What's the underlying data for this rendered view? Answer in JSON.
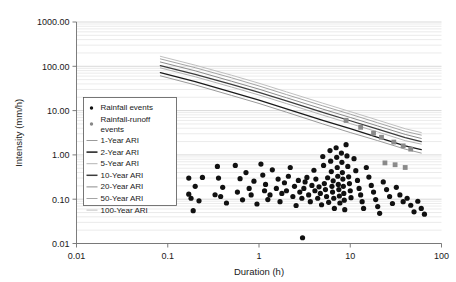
{
  "chart_data": {
    "type": "scatter",
    "title": "",
    "xlabel": "Duration (h)",
    "ylabel": "Intensity (mm/h)",
    "xscale": "log",
    "yscale": "log",
    "xlim": [
      0.01,
      100
    ],
    "ylim": [
      0.01,
      1000
    ],
    "xticks": [
      "0.01",
      "0.1",
      "1",
      "10",
      "100"
    ],
    "xtick_values": [
      0.01,
      0.1,
      1,
      10,
      100
    ],
    "yticks": [
      "0.01",
      "0.10",
      "1.00",
      "10.00",
      "100.00",
      "1000.00"
    ],
    "ytick_values": [
      0.01,
      0.1,
      1,
      10,
      100,
      1000
    ],
    "grid": "minor-horizontal",
    "legend_position": "upper-left-inside",
    "legend_entries": [
      {
        "label": "Rainfall events",
        "marker": "dot",
        "color": "#111111"
      },
      {
        "label": "Rainfall-runoff events",
        "marker": "dot",
        "color": "#888888"
      },
      {
        "label": "1-Year ARI",
        "marker": "line",
        "color": "#9a9a9a"
      },
      {
        "label": "2-Year ARI",
        "marker": "line",
        "color": "#1a1a1a"
      },
      {
        "label": "5-Year ARI",
        "marker": "line",
        "color": "#b4b4b4"
      },
      {
        "label": "10-Year ARI",
        "marker": "line",
        "color": "#3c3c3c"
      },
      {
        "label": "20-Year ARI",
        "marker": "line",
        "color": "#8c8c8c"
      },
      {
        "label": "50-Year ARI",
        "marker": "line",
        "color": "#a5a5a5"
      },
      {
        "label": "100-Year ARI",
        "marker": "line",
        "color": "#c0c0c0"
      }
    ],
    "series": [
      {
        "name": "1-Year ARI",
        "type": "line",
        "color": "#9a9a9a",
        "width": 1.0,
        "points": [
          [
            0.083,
            61
          ],
          [
            0.2,
            38
          ],
          [
            0.5,
            22
          ],
          [
            1,
            14.5
          ],
          [
            2,
            9.2
          ],
          [
            5,
            5.0
          ],
          [
            10,
            3.2
          ],
          [
            20,
            2.1
          ],
          [
            40,
            1.35
          ],
          [
            60,
            1.1
          ]
        ]
      },
      {
        "name": "2-Year ARI",
        "type": "line",
        "color": "#1a1a1a",
        "width": 1.3,
        "points": [
          [
            0.083,
            72
          ],
          [
            0.2,
            45
          ],
          [
            0.5,
            26
          ],
          [
            1,
            17.2
          ],
          [
            2,
            11.0
          ],
          [
            5,
            6.0
          ],
          [
            10,
            3.9
          ],
          [
            20,
            2.5
          ],
          [
            40,
            1.6
          ],
          [
            60,
            1.32
          ]
        ]
      },
      {
        "name": "5-Year ARI",
        "type": "line",
        "color": "#b4b4b4",
        "width": 1.0,
        "points": [
          [
            0.083,
            92
          ],
          [
            0.2,
            58
          ],
          [
            0.5,
            34
          ],
          [
            1,
            22.5
          ],
          [
            2,
            14.4
          ],
          [
            5,
            7.9
          ],
          [
            10,
            5.1
          ],
          [
            20,
            3.3
          ],
          [
            40,
            2.1
          ],
          [
            60,
            1.75
          ]
        ]
      },
      {
        "name": "10-Year ARI",
        "type": "line",
        "color": "#3c3c3c",
        "width": 1.3,
        "points": [
          [
            0.083,
            104
          ],
          [
            0.2,
            66
          ],
          [
            0.5,
            39
          ],
          [
            1,
            25.8
          ],
          [
            2,
            16.5
          ],
          [
            5,
            9.1
          ],
          [
            10,
            5.9
          ],
          [
            20,
            3.8
          ],
          [
            40,
            2.45
          ],
          [
            60,
            2.0
          ]
        ]
      },
      {
        "name": "20-Year ARI",
        "type": "line",
        "color": "#8c8c8c",
        "width": 1.0,
        "points": [
          [
            0.083,
            125
          ],
          [
            0.2,
            79
          ],
          [
            0.5,
            46
          ],
          [
            1,
            30.5
          ],
          [
            2,
            19.5
          ],
          [
            5,
            10.8
          ],
          [
            10,
            7.0
          ],
          [
            20,
            4.5
          ],
          [
            40,
            2.9
          ],
          [
            60,
            2.35
          ]
        ]
      },
      {
        "name": "50-Year ARI",
        "type": "line",
        "color": "#a5a5a5",
        "width": 1.0,
        "points": [
          [
            0.083,
            147
          ],
          [
            0.2,
            93
          ],
          [
            0.5,
            55
          ],
          [
            1,
            36.0
          ],
          [
            2,
            23.0
          ],
          [
            5,
            12.8
          ],
          [
            10,
            8.3
          ],
          [
            20,
            5.3
          ],
          [
            40,
            3.4
          ],
          [
            60,
            2.8
          ]
        ]
      },
      {
        "name": "100-Year ARI",
        "type": "line",
        "color": "#c0c0c0",
        "width": 1.0,
        "points": [
          [
            0.083,
            168
          ],
          [
            0.2,
            106
          ],
          [
            0.5,
            63
          ],
          [
            1,
            41.5
          ],
          [
            2,
            26.5
          ],
          [
            5,
            14.7
          ],
          [
            10,
            9.5
          ],
          [
            20,
            6.1
          ],
          [
            40,
            3.9
          ],
          [
            60,
            3.2
          ]
        ]
      },
      {
        "name": "Rainfall events",
        "type": "scatter",
        "color": "#111111",
        "marker_size": 2.6,
        "points": [
          [
            0.17,
            0.13
          ],
          [
            0.17,
            0.3
          ],
          [
            0.18,
            0.105
          ],
          [
            0.19,
            0.055
          ],
          [
            0.2,
            0.195
          ],
          [
            0.22,
            0.092
          ],
          [
            0.24,
            0.31
          ],
          [
            0.33,
            0.126
          ],
          [
            0.35,
            0.55
          ],
          [
            0.36,
            0.3
          ],
          [
            0.38,
            0.115
          ],
          [
            0.4,
            0.185
          ],
          [
            0.44,
            0.082
          ],
          [
            0.55,
            0.58
          ],
          [
            0.58,
            0.145
          ],
          [
            0.62,
            0.29
          ],
          [
            0.66,
            0.097
          ],
          [
            0.72,
            0.4
          ],
          [
            0.78,
            0.175
          ],
          [
            0.82,
            0.125
          ],
          [
            0.88,
            0.255
          ],
          [
            0.95,
            0.078
          ],
          [
            1.05,
            0.62
          ],
          [
            1.1,
            0.35
          ],
          [
            1.15,
            0.155
          ],
          [
            1.18,
            0.215
          ],
          [
            1.25,
            0.098
          ],
          [
            1.32,
            0.125
          ],
          [
            1.4,
            0.46
          ],
          [
            1.55,
            0.175
          ],
          [
            1.62,
            0.285
          ],
          [
            1.7,
            0.088
          ],
          [
            1.78,
            0.135
          ],
          [
            1.9,
            0.235
          ],
          [
            2.0,
            0.155
          ],
          [
            2.1,
            0.33
          ],
          [
            2.2,
            0.52
          ],
          [
            2.35,
            0.115
          ],
          [
            2.45,
            0.195
          ],
          [
            2.55,
            0.072
          ],
          [
            2.7,
            0.265
          ],
          [
            2.8,
            0.145
          ],
          [
            2.95,
            0.105
          ],
          [
            3.0,
            0.0135
          ],
          [
            3.1,
            0.175
          ],
          [
            3.2,
            0.245
          ],
          [
            3.35,
            0.31
          ],
          [
            3.5,
            0.125
          ],
          [
            3.65,
            0.088
          ],
          [
            3.8,
            0.205
          ],
          [
            4.0,
            0.45
          ],
          [
            4.1,
            0.155
          ],
          [
            4.2,
            0.285
          ],
          [
            4.4,
            0.105
          ],
          [
            4.55,
            0.19
          ],
          [
            4.7,
            0.135
          ],
          [
            4.85,
            0.075
          ],
          [
            5.0,
            0.92
          ],
          [
            5.1,
            0.58
          ],
          [
            5.2,
            0.225
          ],
          [
            5.35,
            0.165
          ],
          [
            5.5,
            0.115
          ],
          [
            5.65,
            0.305
          ],
          [
            5.8,
            0.085
          ],
          [
            6.0,
            1.25
          ],
          [
            6.1,
            0.72
          ],
          [
            6.2,
            0.42
          ],
          [
            6.3,
            0.195
          ],
          [
            6.4,
            0.145
          ],
          [
            6.5,
            0.26
          ],
          [
            6.6,
            0.105
          ],
          [
            6.7,
            0.062
          ],
          [
            7.0,
            1.45
          ],
          [
            7.1,
            0.88
          ],
          [
            7.2,
            0.52
          ],
          [
            7.3,
            0.33
          ],
          [
            7.4,
            0.215
          ],
          [
            7.5,
            0.165
          ],
          [
            7.6,
            0.118
          ],
          [
            7.7,
            0.082
          ],
          [
            8.0,
            1.1
          ],
          [
            8.1,
            0.68
          ],
          [
            8.2,
            0.4
          ],
          [
            8.3,
            0.285
          ],
          [
            8.4,
            0.195
          ],
          [
            8.5,
            0.135
          ],
          [
            8.6,
            0.095
          ],
          [
            8.7,
            0.058
          ],
          [
            9.0,
            1.7
          ],
          [
            9.2,
            0.95
          ],
          [
            9.4,
            0.55
          ],
          [
            9.6,
            0.32
          ],
          [
            9.8,
            0.225
          ],
          [
            10.0,
            0.155
          ],
          [
            10.2,
            0.108
          ],
          [
            11.0,
            0.82
          ],
          [
            11.5,
            0.44
          ],
          [
            12.0,
            0.265
          ],
          [
            12.5,
            0.175
          ],
          [
            13.0,
            0.125
          ],
          [
            13.5,
            0.088
          ],
          [
            14.0,
            0.062
          ],
          [
            15.0,
            0.52
          ],
          [
            16.0,
            0.315
          ],
          [
            17.0,
            0.205
          ],
          [
            18.0,
            0.145
          ],
          [
            19.0,
            0.098
          ],
          [
            20.0,
            0.068
          ],
          [
            21.0,
            0.048
          ],
          [
            23.0,
            0.245
          ],
          [
            25.0,
            0.165
          ],
          [
            27.0,
            0.115
          ],
          [
            29.0,
            0.08
          ],
          [
            32.0,
            0.185
          ],
          [
            35.0,
            0.125
          ],
          [
            38.0,
            0.088
          ],
          [
            42.0,
            0.105
          ],
          [
            46.0,
            0.073
          ],
          [
            50.0,
            0.052
          ],
          [
            55.0,
            0.09
          ],
          [
            60.0,
            0.062
          ],
          [
            65.0,
            0.046
          ]
        ]
      },
      {
        "name": "Rainfall-runoff events",
        "type": "scatter",
        "color": "#8a8a8a",
        "marker_size": 2.4,
        "marker": "square",
        "points": [
          [
            9.0,
            6.0
          ],
          [
            13.0,
            4.2
          ],
          [
            18.0,
            3.1
          ],
          [
            22.0,
            2.5
          ],
          [
            30.0,
            1.95
          ],
          [
            38.0,
            1.6
          ],
          [
            46.0,
            1.35
          ],
          [
            24.0,
            0.66
          ],
          [
            31.0,
            0.6
          ],
          [
            40.0,
            0.52
          ]
        ]
      }
    ]
  },
  "axes": {
    "x_title": "Duration (h)",
    "y_title": "Intensity (mm/h)"
  }
}
